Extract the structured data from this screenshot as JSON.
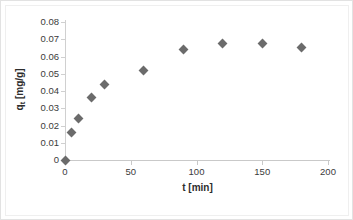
{
  "chart_data": {
    "type": "scatter",
    "title": "",
    "xlabel": "t [min]",
    "ylabel": "q_t [mg/g]",
    "ylabel_base": "q",
    "ylabel_sub": "t",
    "ylabel_unit": " [mg/g]",
    "xlim": [
      0,
      200
    ],
    "ylim": [
      0,
      0.08
    ],
    "grid": false,
    "legend": false,
    "marker": "diamond",
    "marker_color": "#6b6b6b",
    "axis_color": "#c9c9c9",
    "x": [
      0,
      5,
      10,
      20,
      30,
      60,
      90,
      120,
      150,
      180
    ],
    "y": [
      0,
      0.016,
      0.024,
      0.036,
      0.044,
      0.052,
      0.064,
      0.0675,
      0.0675,
      0.0655
    ],
    "series": [
      {
        "name": "qt",
        "points": [
          {
            "x": 0,
            "y": 0
          },
          {
            "x": 5,
            "y": 0.016
          },
          {
            "x": 10,
            "y": 0.024
          },
          {
            "x": 20,
            "y": 0.036
          },
          {
            "x": 30,
            "y": 0.044
          },
          {
            "x": 60,
            "y": 0.052
          },
          {
            "x": 90,
            "y": 0.064
          },
          {
            "x": 120,
            "y": 0.0675
          },
          {
            "x": 150,
            "y": 0.0675
          },
          {
            "x": 180,
            "y": 0.0655
          }
        ]
      }
    ],
    "xticks": [
      0,
      50,
      100,
      150,
      200
    ],
    "xtick_labels": [
      "0",
      "50",
      "100",
      "150",
      "200"
    ],
    "yticks": [
      0,
      0.01,
      0.02,
      0.03,
      0.04,
      0.05,
      0.06,
      0.07,
      0.08
    ],
    "ytick_labels": [
      "0",
      "0.01",
      "0.02",
      "0.03",
      "0.04",
      "0.05",
      "0.06",
      "0.07",
      "0.08"
    ]
  }
}
